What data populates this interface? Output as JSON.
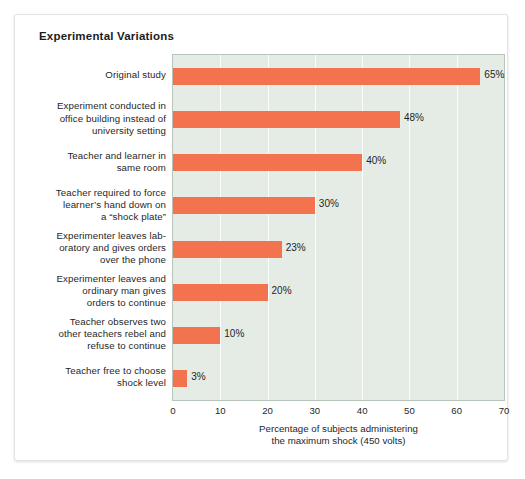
{
  "chart_data": {
    "type": "bar",
    "orientation": "horizontal",
    "title": "Experimental Variations",
    "xlabel_line1": "Percentage of subjects administering",
    "xlabel_line2": "the maximum shock (450 volts)",
    "ylabel": "",
    "xlim": [
      0,
      70
    ],
    "xticks": [
      0,
      10,
      20,
      30,
      40,
      50,
      60,
      70
    ],
    "xtick_labels": [
      "0",
      "10",
      "20",
      "30",
      "40",
      "50",
      "60",
      "70"
    ],
    "grid": "vertical",
    "legend": "none",
    "bar_color": "#F2734E",
    "plot_background": "#E5ECE6",
    "categories": [
      "Original study",
      "Experiment conducted in office building instead of university setting",
      "Teacher and learner in same room",
      "Teacher required to force learner’s hand down on a “shock plate”",
      "Experimenter leaves lab-oratory and gives orders over the phone",
      "Experimenter leaves and ordinary man gives orders to continue",
      "Teacher observes two other teachers rebel and refuse to continue",
      "Teacher free to choose shock level"
    ],
    "category_lines": [
      [
        "Original study"
      ],
      [
        "Experiment conducted in",
        "office building instead of",
        "university setting"
      ],
      [
        "Teacher and learner in",
        "same room"
      ],
      [
        "Teacher required to force",
        "learner’s hand down on",
        "a “shock plate”"
      ],
      [
        "Experimenter leaves lab-",
        "oratory and gives orders",
        "over the phone"
      ],
      [
        "Experimenter leaves and",
        "ordinary man gives",
        "orders to continue"
      ],
      [
        "Teacher observes two",
        "other teachers rebel and",
        "refuse to continue"
      ],
      [
        "Teacher free to choose",
        "shock level"
      ]
    ],
    "values": [
      65,
      48,
      40,
      30,
      23,
      20,
      10,
      3
    ],
    "value_labels": [
      "65%",
      "48%",
      "40%",
      "30%",
      "23%",
      "20%",
      "10%",
      "3%"
    ]
  }
}
